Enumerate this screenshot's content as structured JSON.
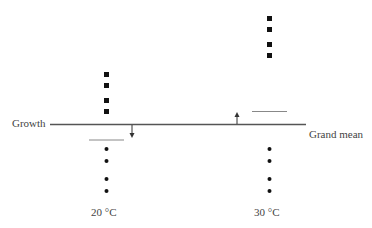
{
  "labels": {
    "growth": "Growth",
    "grand_mean": "Grand mean",
    "group_left": "20 °C",
    "group_right": "30 °C"
  },
  "colors": {
    "line": "#555555",
    "mean_line": "#888888",
    "marker": "#111111"
  },
  "groups": [
    {
      "name": "20 °C",
      "squares_y": [
        74,
        85,
        100,
        111
      ],
      "dots_y": [
        149,
        161,
        179,
        191
      ],
      "group_mean_y": 140,
      "arrow": "down"
    },
    {
      "name": "30 °C",
      "squares_y": [
        18,
        29,
        44,
        55
      ],
      "dots_y": [
        149,
        161,
        179,
        191
      ],
      "group_mean_y": 111,
      "arrow": "up"
    }
  ]
}
